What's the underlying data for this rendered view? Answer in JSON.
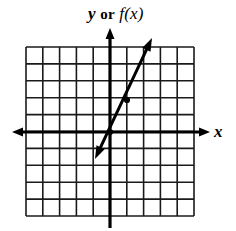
{
  "figure": {
    "kind": "coordinate-grid-line-graph",
    "background_color": "#ffffff",
    "ink_color": "#000000",
    "width": 236,
    "height": 231
  },
  "labels": {
    "y_axis": {
      "full_text": "y or f(x)",
      "variable": "y",
      "conjunction": "or",
      "function": "f(x)"
    },
    "x_axis": {
      "full_text": "x"
    }
  },
  "grid": {
    "left": 26,
    "top": 47,
    "right": 194,
    "bottom": 216,
    "columns": 10,
    "rows": 10,
    "cell_size": 16.85,
    "line_color": "#1a1a1a",
    "line_width": 1.6,
    "visible": true
  },
  "axes": {
    "x_axis": {
      "y_pixel": 132,
      "x_start": 12,
      "x_end": 210,
      "arrow_left": true,
      "arrow_right": true,
      "line_width": 3.2
    },
    "y_axis": {
      "x_pixel": 110,
      "y_start": 28,
      "y_end": 228,
      "arrow_up": true,
      "arrow_down": false,
      "line_width": 3.2
    },
    "origin": {
      "x_pixel": 110,
      "y_pixel": 132
    }
  },
  "chart_data": {
    "type": "line",
    "title": "",
    "xlabel": "x",
    "ylabel": "y or f(x)",
    "xlim": [
      -5,
      5
    ],
    "ylim": [
      -5,
      5
    ],
    "grid": true,
    "legend": null,
    "series": [
      {
        "name": "f(x)",
        "slope": 2,
        "intercept": 0,
        "x": [
          -1,
          0,
          1,
          2.5
        ],
        "y": [
          -2,
          0,
          2,
          5
        ],
        "endpoints_pixel": {
          "lower": [
            95,
            159
          ],
          "upper": [
            152,
            38
          ]
        },
        "arrow_lower": true,
        "arrow_upper": true,
        "line_width": 3.0,
        "marked_points_pixel": [
          [
            110,
            132
          ],
          [
            127,
            100
          ]
        ]
      }
    ]
  }
}
